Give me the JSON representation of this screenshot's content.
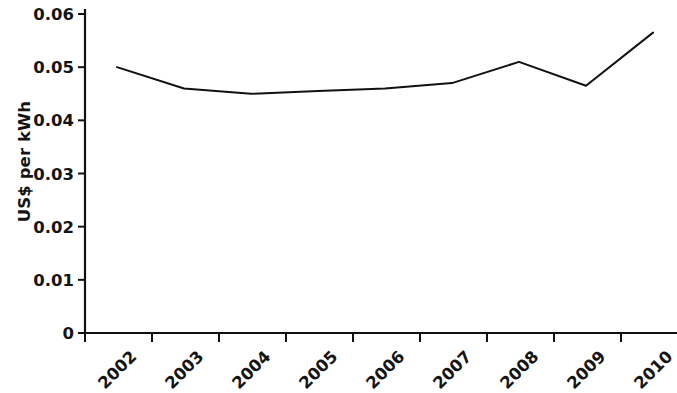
{
  "chart_data": {
    "type": "line",
    "title": "",
    "subtitle": "",
    "xlabel": "",
    "ylabel": "US$ per kWh",
    "categories": [
      "2002",
      "2003",
      "2004",
      "2005",
      "2006",
      "2007",
      "2008",
      "2009",
      "2010"
    ],
    "x": [
      2002,
      2003,
      2004,
      2005,
      2006,
      2007,
      2008,
      2009,
      2010
    ],
    "series": [
      {
        "name": "US$ per kWh",
        "color": "#111111",
        "values": [
          0.05,
          0.046,
          0.045,
          0.0455,
          0.046,
          0.047,
          0.051,
          0.0465,
          0.0565
        ]
      }
    ],
    "ylim": [
      0,
      0.06
    ],
    "ytick_values": [
      0,
      0.01,
      0.02,
      0.03,
      0.04,
      0.05,
      0.06
    ],
    "ytick_labels": [
      "0",
      "0.01",
      "0.02",
      "0.03",
      "0.04",
      "0.05",
      "0.06"
    ],
    "xtick_labels": [
      "2002",
      "2003",
      "2004",
      "2005",
      "2006",
      "2007",
      "2008",
      "2009",
      "2010"
    ],
    "xtick_label_rotation": -45,
    "grid": false,
    "legend": false,
    "legend_position": "none",
    "markers": false,
    "line_width": 2,
    "background_color": "#ffffff",
    "axis_color": "#111111"
  }
}
